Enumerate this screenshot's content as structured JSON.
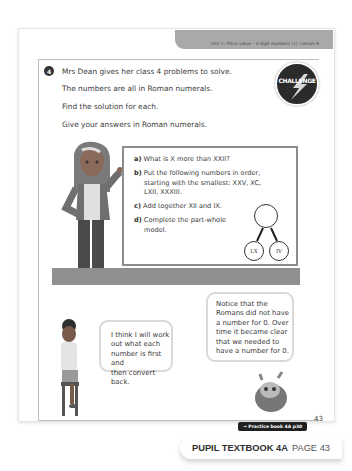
{
  "header": {
    "unit_label": "Unit 1: Place value – 4-digit numbers (1), Lesson 9"
  },
  "question": {
    "number": "4",
    "intro_lines": [
      "Mrs Dean gives her class 4 problems to solve.",
      "The numbers are all in Roman numerals.",
      "Find the solution for each.",
      "Give your answers in Roman numerals."
    ],
    "badge_label": "CHALLENGE",
    "parts": [
      {
        "letter": "a)",
        "text_lines": [
          "What is X more than XXII?"
        ]
      },
      {
        "letter": "b)",
        "text_lines": [
          "Put the following numbers in order,",
          "starting with the smallest: XXV, XC,",
          "LXII, XXXIII."
        ]
      },
      {
        "letter": "c)",
        "text_lines": [
          "Add together XII and IX."
        ]
      },
      {
        "letter": "d)",
        "text_lines": [
          "Complete the part-whole",
          "model."
        ]
      }
    ],
    "part_whole": {
      "whole": "",
      "parts": [
        "LX",
        "IV"
      ]
    }
  },
  "bubbles": {
    "girl": [
      "I think I will work",
      "out what each",
      "number is first and",
      "then convert back."
    ],
    "monster": [
      "Notice that the",
      "Romans did not have",
      "a number for 0. Over",
      "time it became clear",
      "that we needed to",
      "have a number for 0."
    ]
  },
  "practice_book": "→ Practice book 4A p30",
  "page_number": "43",
  "footer": {
    "title": "PUPIL TEXTBOOK 4A",
    "page": "PAGE 43"
  }
}
